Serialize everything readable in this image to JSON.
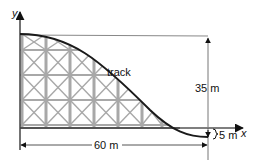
{
  "diagram": {
    "title": "",
    "axes": {
      "x_label": "x",
      "y_label": "y"
    },
    "labels": {
      "track": "track",
      "height": "35 m",
      "dip": "5 m",
      "width": "60 m"
    },
    "dimensions": {
      "horizontal_length_m": 60,
      "height_above_axis_m": 35,
      "depth_below_axis_m": 5
    },
    "colors": {
      "track": "#1a1a1a",
      "scaffold": "#a8a8a8",
      "axes": "#333333",
      "reference_lines": "#777777",
      "background": "#ffffff"
    }
  }
}
